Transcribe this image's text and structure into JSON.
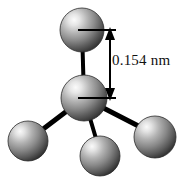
{
  "figure": {
    "background_color": "#ffffff",
    "width": 181,
    "height": 177
  },
  "annotation": {
    "dimension_label": "0.154 nm",
    "dimension_value": 0.154,
    "dimension_unit": "nm",
    "measures": "vertical bond length between top atom and central atom",
    "text_color": "#111111",
    "arrow_color": "#000000"
  },
  "atoms": [
    {
      "id": "atom-top",
      "label": "top atom",
      "cx": 82,
      "cy": 30,
      "r": 22
    },
    {
      "id": "atom-center",
      "label": "central atom",
      "cx": 84,
      "cy": 98,
      "r": 23
    },
    {
      "id": "atom-lower-left",
      "label": "lower left atom",
      "cx": 28,
      "cy": 141,
      "r": 20
    },
    {
      "id": "atom-lower-middle",
      "label": "lower middle atom",
      "cx": 100,
      "cy": 156,
      "r": 20
    },
    {
      "id": "atom-lower-right",
      "label": "lower right atom",
      "cx": 155,
      "cy": 137,
      "r": 21
    }
  ],
  "bonds": [
    {
      "id": "bond-center-top",
      "from": "atom-center",
      "to": "atom-top",
      "width": 4
    },
    {
      "id": "bond-center-lower-left",
      "from": "atom-center",
      "to": "atom-lower-left",
      "width": 5
    },
    {
      "id": "bond-center-lower-middle",
      "from": "atom-center",
      "to": "atom-lower-middle",
      "width": 4
    },
    {
      "id": "bond-center-lower-right",
      "from": "atom-center",
      "to": "atom-lower-right",
      "width": 5
    }
  ],
  "colors": {
    "sphere_highlight": "#f2f2f2",
    "sphere_mid": "#9a9a9a",
    "sphere_shadow": "#3a3a3a",
    "sphere_edge": "#2a2a2a",
    "bond": "#000000",
    "dimension_line": "#000000"
  }
}
